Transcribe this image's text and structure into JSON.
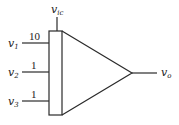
{
  "diagram": {
    "type": "summing-amplifier-block",
    "control_input": {
      "label": "v",
      "subscript": "ic"
    },
    "inputs": [
      {
        "label": "v",
        "subscript": "1",
        "weight": "10"
      },
      {
        "label": "v",
        "subscript": "2",
        "weight": "1"
      },
      {
        "label": "v",
        "subscript": "3",
        "weight": "1"
      }
    ],
    "output": {
      "label": "v",
      "subscript": "o"
    }
  },
  "colors": {
    "stroke": "#2a2a2a",
    "background": "#ffffff"
  }
}
